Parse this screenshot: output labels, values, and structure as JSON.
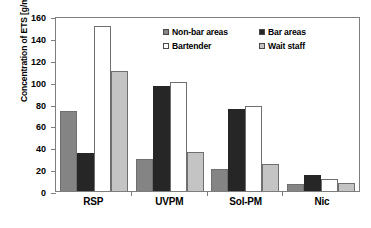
{
  "chart_data": {
    "type": "bar",
    "title": "",
    "xlabel": "",
    "ylabel": "Concentration of ETS [g/m³]",
    "categories": [
      "RSP",
      "UVPM",
      "Sol-PM",
      "Nic"
    ],
    "series": [
      {
        "name": "Non-bar areas",
        "color": "#848484",
        "values": [
          73,
          29,
          20,
          6
        ]
      },
      {
        "name": "Bar areas",
        "color": "#262626",
        "values": [
          35,
          96,
          75,
          15
        ]
      },
      {
        "name": "Bartender",
        "color": "#ffffff",
        "values": [
          151,
          100,
          78,
          11
        ]
      },
      {
        "name": "Wait staff",
        "color": "#c4c4c4",
        "values": [
          110,
          36,
          25,
          7
        ]
      }
    ],
    "ylim": [
      0,
      160
    ],
    "yticks": [
      0,
      20,
      40,
      60,
      80,
      100,
      120,
      140,
      160
    ],
    "ytick_labels": [
      "0",
      "20",
      "40",
      "60",
      "80",
      "100",
      "120",
      "140",
      "160"
    ],
    "grid": false,
    "legend_position": "inside-top-right"
  },
  "axis": {
    "y_title": "Concentration of ETS [g/m³]"
  }
}
